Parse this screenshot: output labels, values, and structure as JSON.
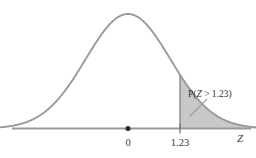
{
  "figure": {
    "title": "",
    "background_color": "#ffffff",
    "curve_color": "#9a9a9a",
    "axis_color": "#9a9a9a",
    "shade_color": "#c8c8c8",
    "shade_edge_color": "#8f8f8f",
    "text_color": "#333333",
    "leader_line_color": "#9a9a9a"
  },
  "axis": {
    "name": "Z",
    "tick_labels": [
      "0",
      "1.23"
    ],
    "mean_label": "0",
    "cutoff_label": "1.23"
  },
  "annotation": {
    "probability_prefix": "P(",
    "probability_variable": "Z",
    "probability_operator": " > ",
    "probability_value": "1.23",
    "probability_suffix": ")",
    "probability_full": "P(Z > 1.23)"
  },
  "chart_data": {
    "type": "area",
    "title": "",
    "xlabel": "Z",
    "ylabel": "",
    "grid": false,
    "legend_position": "none",
    "distribution": "standard normal",
    "mean": 0,
    "sd": 1,
    "xlim": [
      -3.45,
      3.45
    ],
    "ylim": [
      0,
      0.42
    ],
    "tick_values": [
      0,
      1.23
    ],
    "tick_labels": [
      "0",
      "1.23"
    ],
    "shaded_region": {
      "label": "P(Z > 1.23)",
      "from": 1.23,
      "to": 3.45,
      "direction": "right-tail",
      "area": 0.1093
    },
    "x": [
      -3.45,
      -3.2,
      -3.0,
      -2.8,
      -2.6,
      -2.4,
      -2.2,
      -2.0,
      -1.8,
      -1.6,
      -1.4,
      -1.2,
      -1.0,
      -0.8,
      -0.6,
      -0.4,
      -0.2,
      0.0,
      0.2,
      0.4,
      0.6,
      0.8,
      1.0,
      1.2,
      1.23,
      1.4,
      1.6,
      1.8,
      2.0,
      2.2,
      2.4,
      2.6,
      2.8,
      3.0,
      3.2,
      3.45
    ],
    "y": [
      0.0011,
      0.0024,
      0.0044,
      0.0079,
      0.0136,
      0.0224,
      0.0355,
      0.054,
      0.079,
      0.1109,
      0.1497,
      0.1942,
      0.242,
      0.2897,
      0.3332,
      0.3683,
      0.391,
      0.3989,
      0.391,
      0.3683,
      0.3332,
      0.2897,
      0.242,
      0.1942,
      0.1872,
      0.1497,
      0.1109,
      0.079,
      0.054,
      0.0355,
      0.0224,
      0.0136,
      0.0079,
      0.0044,
      0.0024,
      0.0011
    ]
  }
}
